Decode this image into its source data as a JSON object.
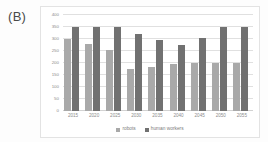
{
  "panel": {
    "label": "(B)"
  },
  "legend": {
    "position": "bottom-center",
    "items": [
      {
        "label": "robots",
        "color": "#a9a9a9"
      },
      {
        "label": "human workers",
        "color": "#717171"
      }
    ]
  },
  "chart_data": {
    "type": "bar",
    "title": "",
    "xlabel": "",
    "ylabel": "",
    "ylim": [
      0,
      400
    ],
    "ytick_values": [
      0,
      50,
      100,
      150,
      200,
      250,
      300,
      350,
      400
    ],
    "ytick_labels": [
      "0",
      "50",
      "100",
      "150",
      "200",
      "250",
      "300",
      "350",
      "400"
    ],
    "grid": true,
    "legend_position": "bottom",
    "categories": [
      "2015",
      "2020",
      "2025",
      "2030",
      "2035",
      "2040",
      "2045",
      "2050",
      "2055"
    ],
    "series": [
      {
        "name": "robots",
        "color": "#a9a9a9",
        "values": [
          300,
          280,
          255,
          175,
          185,
          195,
          200,
          200,
          200
        ]
      },
      {
        "name": "human workers",
        "color": "#717171",
        "values": [
          350,
          350,
          350,
          320,
          295,
          275,
          305,
          350,
          350
        ]
      }
    ]
  }
}
